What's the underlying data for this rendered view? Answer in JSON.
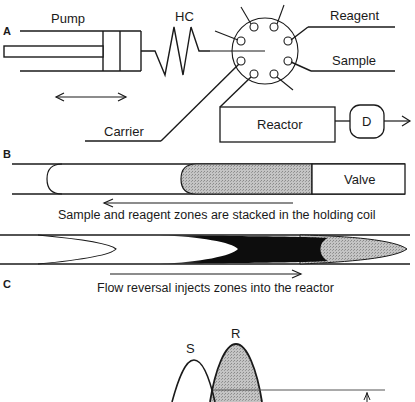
{
  "panels": {
    "a": "A",
    "b": "B",
    "c": "C"
  },
  "panel_a": {
    "pump_label": "Pump",
    "hc_label": "HC",
    "reagent_label": "Reagent",
    "sample_label": "Sample",
    "carrier_label": "Carrier",
    "reactor_label": "Reactor",
    "detector_label": "D"
  },
  "panel_b": {
    "valve_label": "Valve",
    "caption": "Sample and reagent zones are stacked in the holding coil"
  },
  "panel_c": {
    "caption": "Flow reversal injects zones into the reactor"
  },
  "peaks": {
    "s_label": "S",
    "r_label": "R"
  },
  "colors": {
    "line": "#1a1a1a",
    "stipple_gray": "#b3b3b3",
    "dark_zone": "#0d0d0d"
  }
}
